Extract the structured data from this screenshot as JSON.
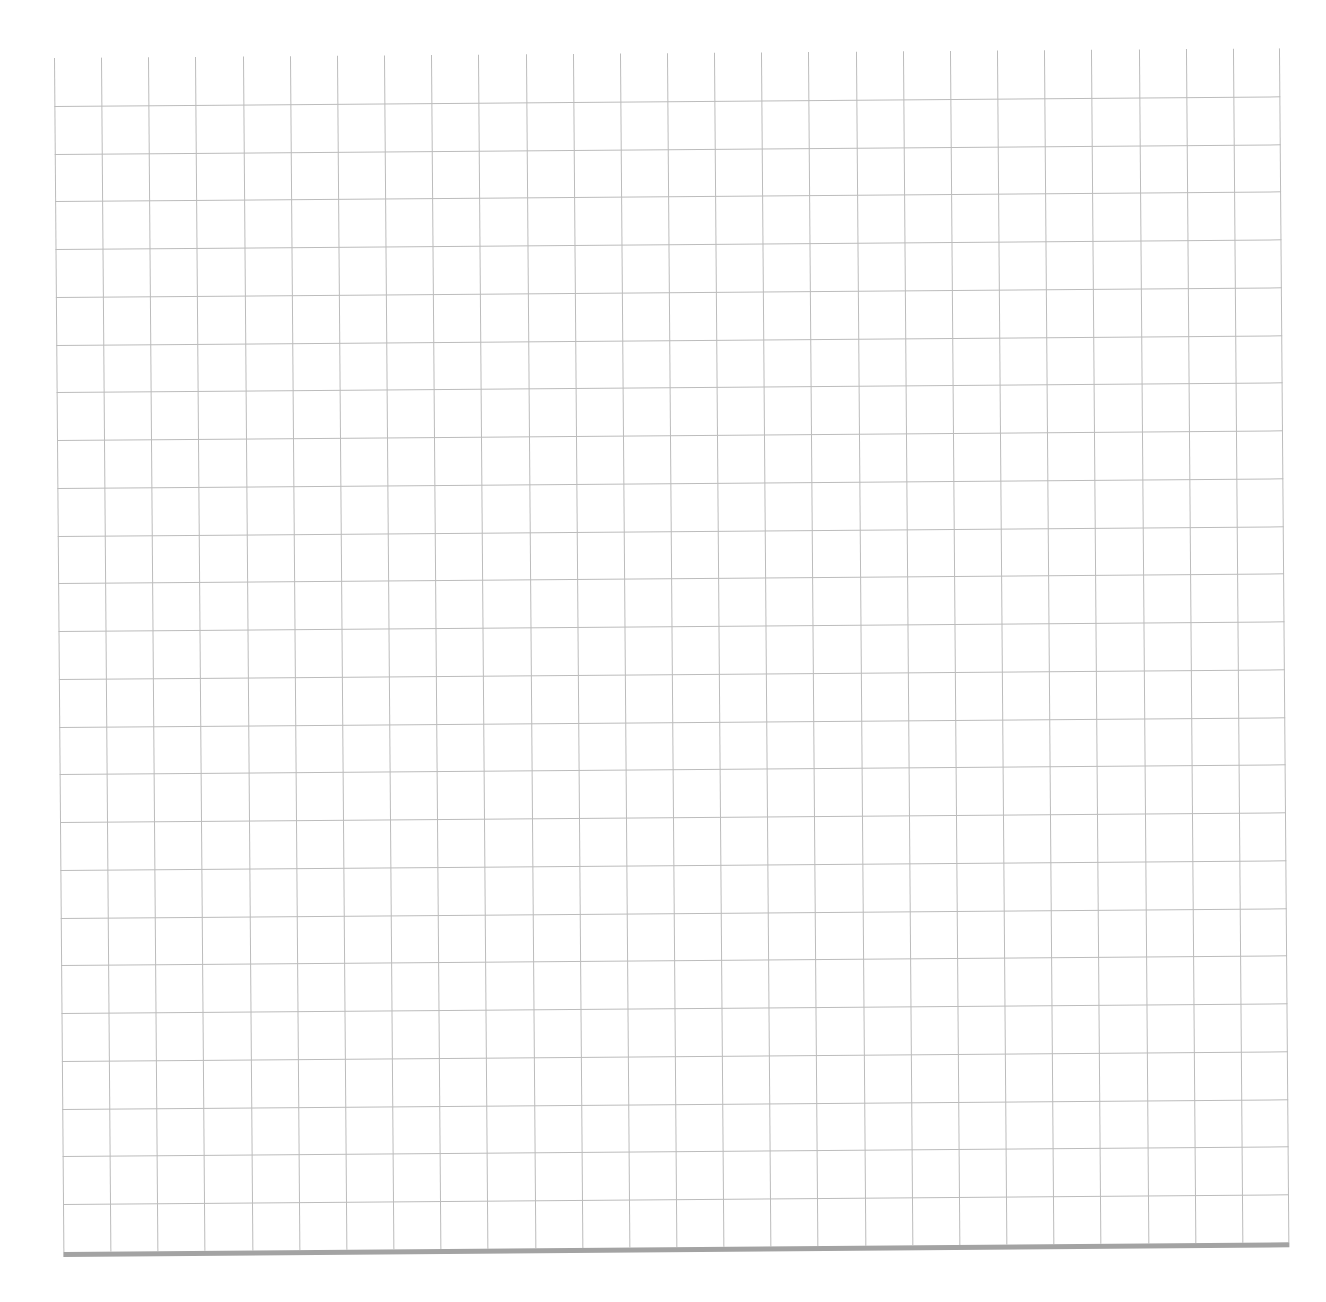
{
  "document": {
    "type": "graph-paper-scan",
    "header_text": "",
    "grid": {
      "columns": 26,
      "rows": 25,
      "cell_width_px": 47.15,
      "cell_height_px": 47.76,
      "line_color": "#bcbcbc",
      "bottom_bar_color": "#a3a3a3",
      "background_color": "#ffffff",
      "has_top_border": false,
      "has_left_border": true,
      "has_right_border": true,
      "has_bottom_border": true
    }
  }
}
